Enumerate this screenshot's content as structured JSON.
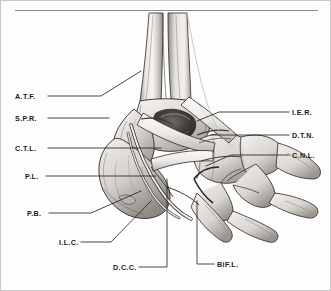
{
  "figure": {
    "kind": "anatomical-line-illustration",
    "palette": {
      "background": "#fdfdfd",
      "ink": "#1b1b1b",
      "rule": "#8a8a8a",
      "border": "#c8c8c8",
      "bone_light": "#f2f0ee",
      "bone_mid": "#cfcbc6",
      "bone_shadow": "#8f8a85",
      "deep_shadow": "#4a4744"
    }
  },
  "labels": {
    "left": [
      {
        "id": "atf",
        "text": "A.T.F.",
        "x": 14,
        "y": 92
      },
      {
        "id": "spr",
        "text": "S.P.R.",
        "x": 14,
        "y": 114
      },
      {
        "id": "ctl",
        "text": "C.T.L.",
        "x": 14,
        "y": 144
      },
      {
        "id": "pl",
        "text": "P.L.",
        "x": 24,
        "y": 172
      },
      {
        "id": "pb",
        "text": "P.B.",
        "x": 26,
        "y": 209
      }
    ],
    "right": [
      {
        "id": "ier",
        "text": "I.E.R.",
        "x": 291,
        "y": 108
      },
      {
        "id": "dtn",
        "text": "D.T.N.",
        "x": 291,
        "y": 131
      },
      {
        "id": "cnl",
        "text": "C.N.L.",
        "x": 291,
        "y": 151
      }
    ],
    "bottom": [
      {
        "id": "ilc",
        "text": "I.L.C.",
        "x": 58,
        "y": 238
      },
      {
        "id": "dcc",
        "text": "D.C.C.",
        "x": 112,
        "y": 263
      },
      {
        "id": "bifl",
        "text": "BiF.L.",
        "x": 216,
        "y": 260
      }
    ]
  },
  "leader_lines": {
    "atf": "M47,95 L100,95 L140,70",
    "spr": "M47,117 L108,117",
    "ctl": "M47,147 L160,147",
    "pl": "M45,175 L155,175",
    "pb": "M48,212 L90,212 L140,190",
    "ilc": "M80,241 L110,241 L150,200",
    "dcc": "M138,266 L166,266 L166,178",
    "bifl": "M213,263 L196,263 L196,200",
    "ier": "M288,111 L218,111 L196,120",
    "dtn": "M288,134 L210,134",
    "cnl": "M288,154 L230,154 L205,165"
  }
}
